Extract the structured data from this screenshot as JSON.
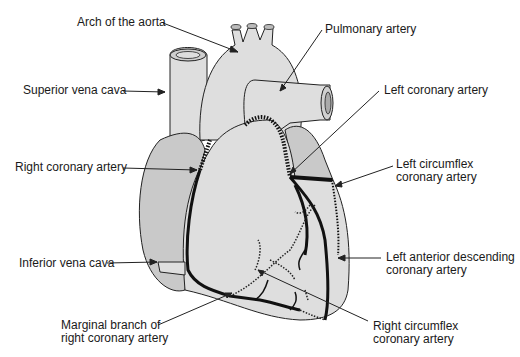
{
  "diagram": {
    "colors": {
      "background": "#ffffff",
      "heart_fill": "#dedede",
      "atrium_fill": "#c9c9c9",
      "outline": "#222222",
      "artery": "#111111",
      "label_text": "#1a1a1a"
    },
    "labels": {
      "arch_of_aorta": "Arch of the aorta",
      "pulmonary_artery": "Pulmonary artery",
      "superior_vena_cava": "Superior vena cava",
      "left_coronary_artery": "Left coronary artery",
      "right_coronary_artery": "Right coronary artery",
      "left_circumflex_line1": "Left circumflex",
      "left_circumflex_line2": "coronary artery",
      "inferior_vena_cava": "Inferior vena cava",
      "lad_line1": "Left anterior descending",
      "lad_line2": "coronary artery",
      "marginal_line1": "Marginal branch of",
      "marginal_line2": "right coronary artery",
      "right_circumflex_line1": "Right circumflex",
      "right_circumflex_line2": "coronary artery"
    }
  }
}
